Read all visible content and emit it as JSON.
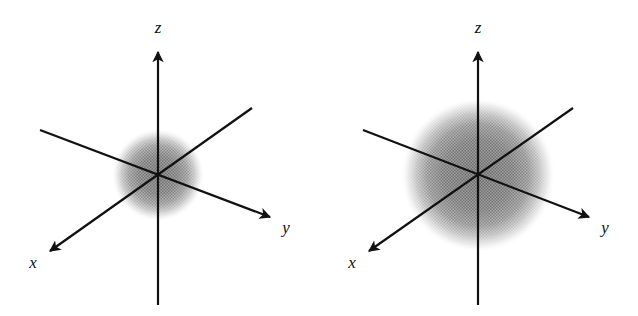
{
  "figure": {
    "background_color": "#ffffff",
    "width": 638,
    "height": 316,
    "panel_count": 2
  },
  "style": {
    "axis_color": "#111111",
    "axis_stroke_width": 2.2,
    "cloud_color": "#8a8a8a",
    "cloud_core_color": "#6e6e6e",
    "label_color": "#111111"
  },
  "panels": [
    {
      "id": "left",
      "name": "small-orbital-panel",
      "cloud": {
        "name": "electron-density-cloud",
        "center_x": 158,
        "center_y": 175,
        "radius": 46,
        "relative_size": "small"
      },
      "axes": [
        {
          "id": "z",
          "label": "z",
          "orientation": "vertical",
          "start_x": 158,
          "start_y": 305,
          "end_x": 158,
          "end_y": 50,
          "arrow_at": "end",
          "label_x": 158,
          "label_y": 33
        },
        {
          "id": "y",
          "label": "y",
          "orientation": "upper-left-to-lower-right",
          "start_x": 40,
          "start_y": 130,
          "end_x": 272,
          "end_y": 218,
          "arrow_at": "end",
          "label_x": 286,
          "label_y": 233
        },
        {
          "id": "x",
          "label": "x",
          "orientation": "upper-right-to-lower-left",
          "start_x": 252,
          "start_y": 108,
          "end_x": 48,
          "end_y": 253,
          "arrow_at": "end",
          "label_x": 33,
          "label_y": 268
        }
      ]
    },
    {
      "id": "right",
      "name": "large-orbital-panel",
      "cloud": {
        "name": "electron-density-cloud",
        "center_x": 159,
        "center_y": 175,
        "radius": 77,
        "relative_size": "large"
      },
      "axes": [
        {
          "id": "z",
          "label": "z",
          "orientation": "vertical",
          "start_x": 159,
          "start_y": 305,
          "end_x": 159,
          "end_y": 50,
          "arrow_at": "end",
          "label_x": 159,
          "label_y": 33
        },
        {
          "id": "y",
          "label": "y",
          "orientation": "upper-left-to-lower-right",
          "start_x": 44,
          "start_y": 130,
          "end_x": 272,
          "end_y": 218,
          "arrow_at": "end",
          "label_x": 286,
          "label_y": 233
        },
        {
          "id": "x",
          "label": "x",
          "orientation": "upper-right-to-lower-left",
          "start_x": 254,
          "start_y": 108,
          "end_x": 48,
          "end_y": 253,
          "arrow_at": "end",
          "label_x": 33,
          "label_y": 268
        }
      ]
    }
  ]
}
